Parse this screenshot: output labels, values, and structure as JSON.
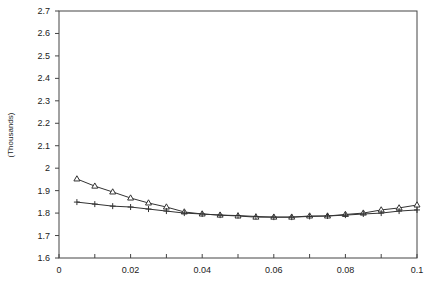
{
  "chart_data": {
    "type": "line",
    "title": "",
    "xlabel": "",
    "ylabel": "(Thousands)",
    "xlim": [
      0,
      0.1
    ],
    "ylim": [
      1.6,
      2.7
    ],
    "grid": false,
    "legend": null,
    "x_ticks": [
      "0",
      "0.02",
      "0.04",
      "0.06",
      "0.08",
      "0.1"
    ],
    "x_minor_ticks": [
      0.01,
      0.03,
      0.05,
      0.07,
      0.09
    ],
    "y_ticks": [
      "1.6",
      "1.7",
      "1.8",
      "1.9",
      "2",
      "2.1",
      "2.2",
      "2.3",
      "2.4",
      "2.5",
      "2.6",
      "2.7"
    ],
    "x": [
      0.005,
      0.01,
      0.015,
      0.02,
      0.025,
      0.03,
      0.035,
      0.04,
      0.045,
      0.05,
      0.055,
      0.06,
      0.065,
      0.07,
      0.075,
      0.08,
      0.085,
      0.09,
      0.095,
      0.1
    ],
    "series": [
      {
        "name": "triangle-series",
        "marker": "triangle",
        "values": [
          1.952,
          1.92,
          1.894,
          1.867,
          1.845,
          1.827,
          1.805,
          1.796,
          1.791,
          1.787,
          1.782,
          1.782,
          1.782,
          1.787,
          1.787,
          1.794,
          1.8,
          1.814,
          1.823,
          1.836
        ]
      },
      {
        "name": "plus-series",
        "marker": "plus",
        "values": [
          1.849,
          1.84,
          1.831,
          1.827,
          1.818,
          1.809,
          1.8,
          1.796,
          1.791,
          1.789,
          1.785,
          1.782,
          1.782,
          1.785,
          1.787,
          1.791,
          1.796,
          1.8,
          1.809,
          1.814
        ]
      }
    ]
  },
  "colors": {
    "line": "#333333",
    "axis": "#444444"
  }
}
